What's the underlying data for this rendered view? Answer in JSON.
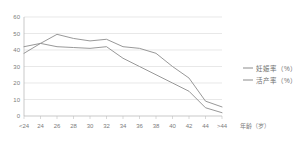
{
  "chart_data": {
    "type": "line",
    "title": "",
    "xlabel": "年龄（岁）",
    "ylabel": "",
    "categories": [
      "<24",
      "24",
      "26",
      "28",
      "30",
      "32",
      "34",
      "36",
      "38",
      "40",
      "42",
      "44",
      ">44"
    ],
    "ylim": [
      0,
      60
    ],
    "yticks": [
      0,
      10,
      20,
      30,
      40,
      50,
      60
    ],
    "grid": true,
    "legend_position": "right",
    "series": [
      {
        "name": "妊娠率（%）",
        "color": "#8c8c8c",
        "values": [
          42,
          44,
          49.5,
          47,
          45.5,
          46.5,
          42,
          41,
          38,
          30,
          23,
          9,
          5.5
        ]
      },
      {
        "name": "活产率（%）",
        "color": "#8c8c8c",
        "values": [
          38,
          44,
          42,
          41.5,
          41,
          42,
          35,
          30,
          25,
          20,
          15,
          5,
          2
        ]
      }
    ]
  },
  "axis": {
    "x_tick_labels": [
      "<24",
      "24",
      "26",
      "28",
      "30",
      "32",
      "34",
      "36",
      "38",
      "40",
      "42",
      "44",
      ">44"
    ],
    "y_tick_labels": [
      "0",
      "10",
      "20",
      "30",
      "40",
      "50",
      "60"
    ],
    "x_axis_title": "年龄（岁）"
  },
  "legend": {
    "items": [
      {
        "label": "妊娠率（%）"
      },
      {
        "label": "活产率（%）"
      }
    ]
  }
}
